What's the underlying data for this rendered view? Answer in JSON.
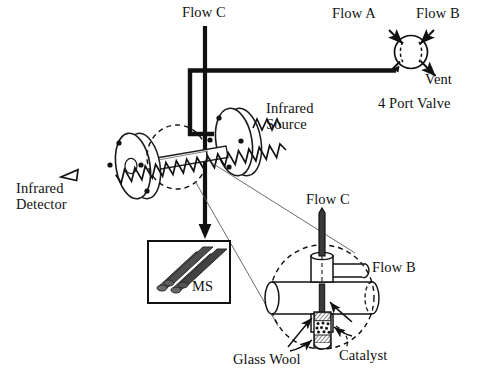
{
  "diagram": {
    "labels": {
      "flow_c_top": "Flow C",
      "flow_a": "Flow A",
      "flow_b_top": "Flow B",
      "vent": "Vent",
      "four_port_valve": "4 Port Valve",
      "infrared_source_line1": "Infrared",
      "infrared_source_line2": "Source",
      "infrared_detector_line1": "Infrared",
      "infrared_detector_line2": "Detector",
      "ms": "MS",
      "flow_c_detail": "Flow C",
      "flow_b_detail": "Flow B",
      "glass_wool": "Glass Wool",
      "catalyst": "Catalyst"
    },
    "icons": {
      "ms_quadrupole": "quadrupole-rods-icon",
      "valve": "four-port-valve-icon",
      "ir_beam": "infrared-wave-icon",
      "catalyst_bed": "catalyst-bed-icon",
      "glass_wool_plug": "glass-wool-icon"
    },
    "colors": {
      "ink": "#111111",
      "line": "#1a1a1a",
      "thin": "#4a4a4a",
      "fill_white": "#ffffff",
      "rod_dark": "#5a5a5a",
      "rod_darker": "#3d3d3d"
    },
    "components": [
      {
        "name": "four-port-valve",
        "shape": "circle-with-two-dashed-arcs",
        "ports": 4
      },
      {
        "name": "infrared-cell",
        "shape": "two-flanges-with-tube",
        "bolt_holes_per_flange": 4
      },
      {
        "name": "mass-spectrometer",
        "shape": "box-with-quadrupole-rods"
      },
      {
        "name": "reactor-detail",
        "shape": "dashed-circle-callout"
      }
    ]
  }
}
